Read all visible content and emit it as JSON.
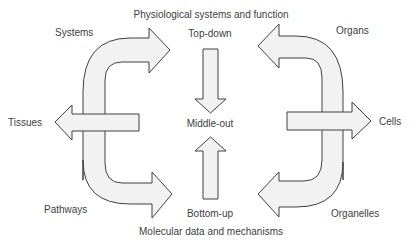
{
  "diagram": {
    "title_top": "Physiological systems and function",
    "title_bottom": "Molecular data and mechanisms",
    "center_labels": {
      "top": "Top-down",
      "middle": "Middle-out",
      "bottom": "Bottom-up"
    },
    "left_labels": {
      "top": "Systems",
      "middle": "Tissues",
      "bottom": "Pathways"
    },
    "right_labels": {
      "top": "Organs",
      "middle": "Cells",
      "bottom": "Organelles"
    },
    "colors": {
      "arrow_fill": "#f2f2f2",
      "arrow_stroke": "#404040",
      "text": "#404040",
      "background": "#ffffff"
    }
  }
}
